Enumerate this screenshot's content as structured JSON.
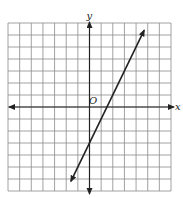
{
  "chart_data": {
    "type": "line",
    "title": "",
    "xlabel": "x",
    "ylabel": "y",
    "origin_label": "O",
    "grid": true,
    "xlim": [
      -7,
      7
    ],
    "ylim": [
      -7,
      7
    ],
    "series": [
      {
        "name": "line",
        "equation": "y = 2x - 3",
        "slope": 2,
        "intercept": -3,
        "x": [
          -1.6,
          4.7
        ],
        "y": [
          -6.2,
          6.4
        ],
        "arrows": "both"
      }
    ]
  },
  "colors": {
    "grid": "#8a8a8a",
    "axis": "#222222",
    "line": "#222222",
    "background": "#ffffff"
  }
}
